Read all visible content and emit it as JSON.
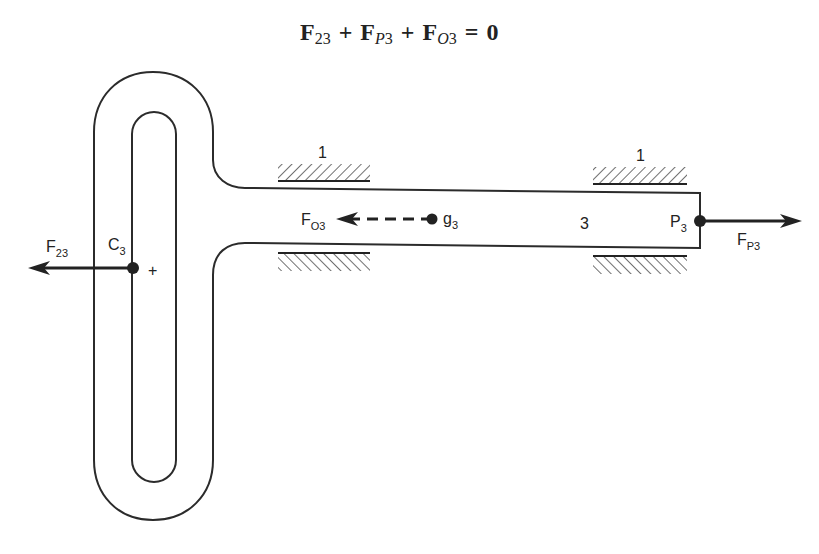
{
  "equation": {
    "terms": [
      {
        "symbol": "F",
        "subscript": "23",
        "subscript_italic": false
      },
      {
        "symbol": "F",
        "subscript_parts": [
          {
            "text": "P",
            "italic": true
          },
          {
            "text": "3",
            "italic": false
          }
        ]
      },
      {
        "symbol": "F",
        "subscript_parts": [
          {
            "text": "O",
            "italic": true
          },
          {
            "text": "3",
            "italic": false
          }
        ]
      }
    ],
    "operators": [
      "+",
      "+",
      "="
    ],
    "rhs": "0",
    "text": "F23 + FP3 + FO3 = 0"
  },
  "labels": {
    "ground_top_left": "1",
    "ground_top_right": "1",
    "link_number": "3",
    "f23": {
      "main": "F",
      "sub": "23"
    },
    "c3": {
      "main": "C",
      "sub": "3"
    },
    "fo3": {
      "main": "F",
      "sub": "O3"
    },
    "g3": {
      "main": "g",
      "sub": "3"
    },
    "p3": {
      "main": "P",
      "sub": "3"
    },
    "fp3": {
      "main": "F",
      "sub": "P3"
    },
    "plus_marker": "+"
  },
  "forces": [
    {
      "name": "F23",
      "point": "C3",
      "direction": "left",
      "style": "solid"
    },
    {
      "name": "FO3",
      "point": "g3",
      "direction": "left",
      "style": "dashed"
    },
    {
      "name": "FP3",
      "point": "P3",
      "direction": "right",
      "style": "solid"
    }
  ],
  "colors": {
    "ink": "#222222",
    "background": "#ffffff"
  }
}
